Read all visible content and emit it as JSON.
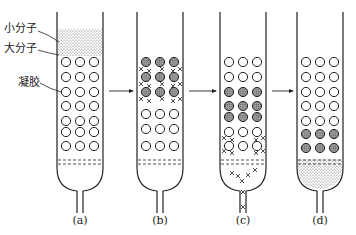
{
  "figure": {
    "labels": {
      "small_molecule": "小分子",
      "large_molecule": "大分子",
      "gel": "凝胶"
    },
    "columns": [
      {
        "id": "a",
        "caption": "(a)",
        "left": 57,
        "right": 103,
        "stipple_top": [
          29,
          56
        ],
        "plain_rows": [
          62,
          77,
          92,
          106,
          121,
          132,
          146
        ],
        "filled_rows": [],
        "cross_rows": [],
        "bottom_stipple": false,
        "bottom_crosses": false,
        "outlet_crosses": false
      },
      {
        "id": "b",
        "caption": "(b)",
        "left": 137,
        "right": 183,
        "stipple_top": null,
        "plain_rows": [
          114,
          129,
          146
        ],
        "filled_rows": [
          62,
          77,
          92
        ],
        "cross_rows": [
          70,
          85,
          100
        ],
        "bottom_stipple": false,
        "bottom_crosses": false,
        "outlet_crosses": false
      },
      {
        "id": "c",
        "caption": "(c)",
        "left": 220,
        "right": 266,
        "stipple_top": null,
        "plain_rows": [
          62,
          77,
          132,
          146
        ],
        "filled_rows": [
          92,
          106,
          117
        ],
        "cross_rows": [
          139,
          152
        ],
        "bottom_stipple": false,
        "bottom_crosses": true,
        "outlet_crosses": true
      },
      {
        "id": "d",
        "caption": "(d)",
        "left": 297,
        "right": 343,
        "stipple_top": null,
        "plain_rows": [
          62,
          77,
          92,
          106,
          121
        ],
        "filled_rows": [
          134,
          148
        ],
        "cross_rows": [],
        "bottom_stipple": true,
        "bottom_crosses": false,
        "outlet_crosses": false
      }
    ],
    "arrows": [
      {
        "from": "a",
        "to": "b",
        "y": 91
      },
      {
        "from": "b",
        "to": "c",
        "y": 91
      },
      {
        "from": "c",
        "to": "d",
        "y": 91
      }
    ],
    "colors": {
      "line": "#222222",
      "stipple": "#555555",
      "filled_circle": "#8a8a8a",
      "background": "#ffffff"
    }
  }
}
